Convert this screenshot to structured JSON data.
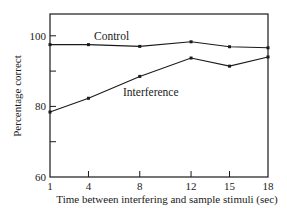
{
  "chart_data": {
    "type": "line",
    "title": "",
    "xlabel": "Time between interfering and sample stimuli (sec)",
    "ylabel": "Percentage correct",
    "x": [
      1,
      4,
      8,
      12,
      15,
      18
    ],
    "x_tick_labels": [
      "1",
      "4",
      "8",
      "12",
      "15",
      "18"
    ],
    "y_tick_labels": [
      "60",
      "80",
      "100"
    ],
    "y_minor_ticks": [
      70,
      90
    ],
    "ylim": [
      60,
      105
    ],
    "grid": false,
    "legend": "inline labels",
    "series": [
      {
        "name": "Control",
        "values": [
          97.5,
          97.5,
          97.0,
          98.3,
          96.9,
          96.6
        ]
      },
      {
        "name": "Interference",
        "values": [
          78.4,
          82.3,
          88.5,
          93.7,
          91.4,
          94.0
        ]
      }
    ]
  },
  "labels": {
    "control": "Control",
    "interference": "Interference"
  }
}
